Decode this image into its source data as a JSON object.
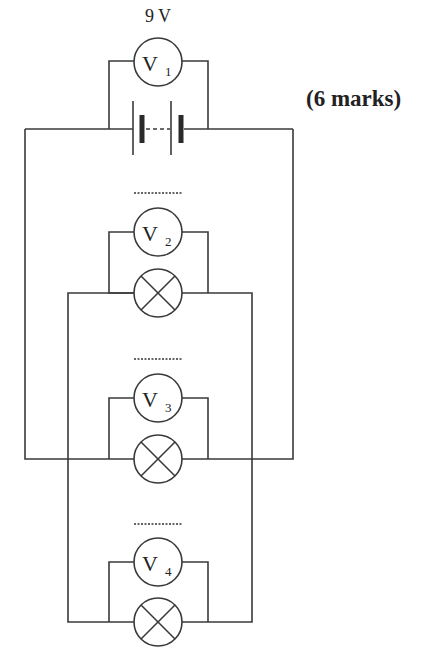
{
  "question": {
    "marks_label": "(6 marks)"
  },
  "battery": {
    "voltage_label": "9 V"
  },
  "voltmeters": [
    {
      "symbol": "V",
      "subscript": "1",
      "reading": "9 V"
    },
    {
      "symbol": "V",
      "subscript": "2",
      "reading": "........"
    },
    {
      "symbol": "V",
      "subscript": "3",
      "reading": "........"
    },
    {
      "symbol": "V",
      "subscript": "4",
      "reading": "........"
    }
  ],
  "lamps": [
    {
      "id": "lamp-1",
      "parallel_with": "V2"
    },
    {
      "id": "lamp-2",
      "parallel_with": "V3"
    },
    {
      "id": "lamp-3",
      "parallel_with": "V4"
    }
  ],
  "colors": {
    "line": "#3a3a3a",
    "background": "#ffffff"
  }
}
